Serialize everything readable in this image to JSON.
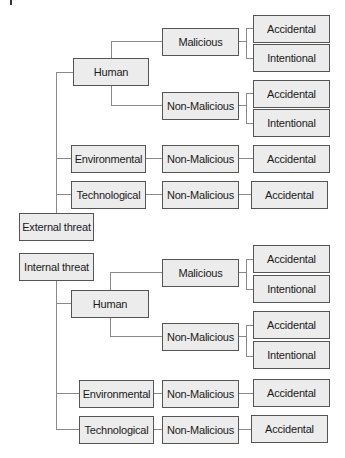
{
  "diagram": {
    "type": "tree",
    "colors": {
      "box_fill": "#ececec",
      "box_border": "#555555",
      "connector": "#8a8a8a",
      "text": "#1a1a1a"
    },
    "external": {
      "root": "External threat",
      "human": {
        "label": "Human",
        "malicious": {
          "label": "Malicious",
          "children": [
            "Accidental",
            "Intentional"
          ]
        },
        "non_malicious": {
          "label": "Non-Malicious",
          "children": [
            "Accidental",
            "Intentional"
          ]
        }
      },
      "environmental": {
        "label": "Environmental",
        "motive": "Non-Malicious",
        "outcome": "Accidental"
      },
      "technological": {
        "label": "Technological",
        "motive": "Non-Malicious",
        "outcome": "Accidental"
      }
    },
    "internal": {
      "root": "Internal threat",
      "human": {
        "label": "Human",
        "malicious": {
          "label": "Malicious",
          "children": [
            "Accidental",
            "Intentional"
          ]
        },
        "non_malicious": {
          "label": "Non-Malicious",
          "children": [
            "Accidental",
            "Intentional"
          ]
        }
      },
      "environmental": {
        "label": "Environmental",
        "motive": "Non-Malicious",
        "outcome": "Accidental"
      },
      "technological": {
        "label": "Technological",
        "motive": "Non-Malicious",
        "outcome": "Accidental"
      }
    }
  }
}
